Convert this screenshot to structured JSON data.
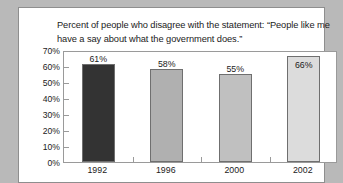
{
  "chart_data": {
    "type": "bar",
    "title": "Percent of people who disagree with the statement: “People like me have a say about what the government does.”",
    "categories": [
      "1992",
      "1996",
      "2000",
      "2002"
    ],
    "values": [
      61,
      58,
      55,
      66
    ],
    "value_labels": [
      "61%",
      "58%",
      "55%",
      "66%"
    ],
    "bar_colors": [
      "#333333",
      "#b0b0b0",
      "#c0c0c0",
      "#dcdcdc"
    ],
    "label_placement": [
      "above",
      "above",
      "above",
      "inside"
    ],
    "xlabel": "",
    "ylabel": "",
    "ylim": [
      0,
      70
    ],
    "ytick_values": [
      70,
      60,
      50,
      40,
      30,
      20,
      10,
      0
    ],
    "ytick_labels": [
      "70%",
      "60%",
      "50%",
      "40%",
      "30%",
      "20%",
      "10%",
      "0%"
    ],
    "grid": false,
    "legend": false
  },
  "figure": {
    "background_color": "#b9b9b9",
    "card_color": "#ffffff",
    "axis_color": "#9a9a9a",
    "text_color": "#1b1b1b"
  }
}
